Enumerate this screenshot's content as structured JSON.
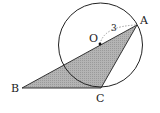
{
  "diagram": {
    "type": "geometry",
    "circle": {
      "center_label": "O",
      "radius_label": "3",
      "cx": 100,
      "cy": 45,
      "r": 42
    },
    "points": {
      "A": {
        "label": "A",
        "x": 137,
        "y": 25
      },
      "B": {
        "label": "B",
        "x": 22,
        "y": 88
      },
      "C": {
        "label": "C",
        "x": 101,
        "y": 88
      },
      "O": {
        "label": "O",
        "x": 100,
        "y": 44
      }
    },
    "colors": {
      "fill": "#a8a8a8",
      "stroke": "#222222",
      "dashed": "#888888"
    }
  }
}
